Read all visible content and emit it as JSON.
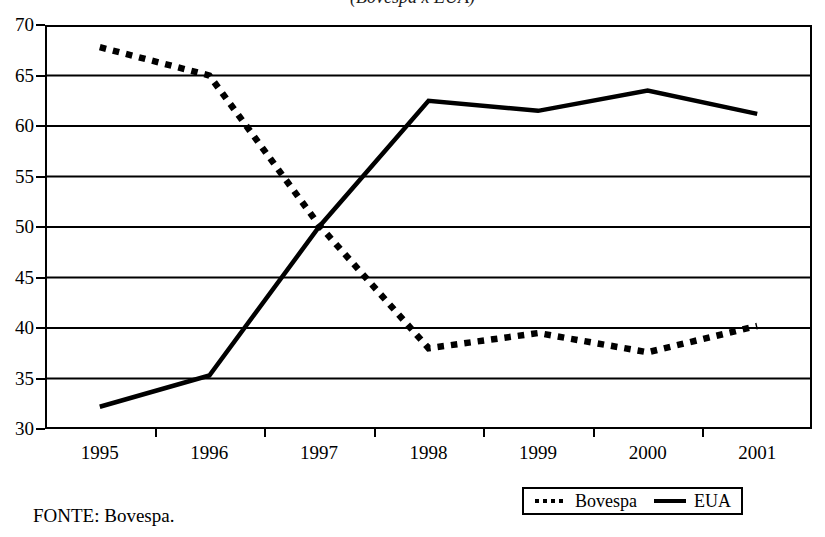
{
  "chart_data": {
    "type": "line",
    "title": "(Bovespa x EUA)",
    "xlabel": "",
    "ylabel": "",
    "x": [
      "1995",
      "1996",
      "1997",
      "1998",
      "1999",
      "2000",
      "2001"
    ],
    "categories": [
      "1995",
      "1996",
      "1997",
      "1998",
      "1999",
      "2000",
      "2001"
    ],
    "ylim": [
      30,
      70
    ],
    "yticks": [
      30,
      35,
      40,
      45,
      50,
      55,
      60,
      65,
      70
    ],
    "grid": "horizontal",
    "legend_position": "bottom-right",
    "series": [
      {
        "name": "Bovespa",
        "style": "dotted",
        "color": "#000000",
        "values": [
          67.8,
          65.0,
          50.2,
          38.0,
          39.5,
          37.6,
          40.2
        ]
      },
      {
        "name": "EUA",
        "style": "solid",
        "color": "#000000",
        "values": [
          32.2,
          35.3,
          50.0,
          62.5,
          61.5,
          63.5,
          61.2
        ]
      }
    ],
    "source_note": "FONTE: Bovespa."
  },
  "axis": {
    "y_tick_labels": [
      "70",
      "65",
      "60",
      "55",
      "50",
      "45",
      "40",
      "35",
      "30"
    ],
    "x_tick_labels": [
      "1995",
      "1996",
      "1997",
      "1998",
      "1999",
      "2000",
      "2001"
    ]
  },
  "legend": {
    "items": [
      {
        "label": "Bovespa",
        "key": "dotted-line-key"
      },
      {
        "label": "EUA",
        "key": "solid-line-key"
      }
    ]
  },
  "footer": {
    "source": "FONTE: Bovespa."
  }
}
